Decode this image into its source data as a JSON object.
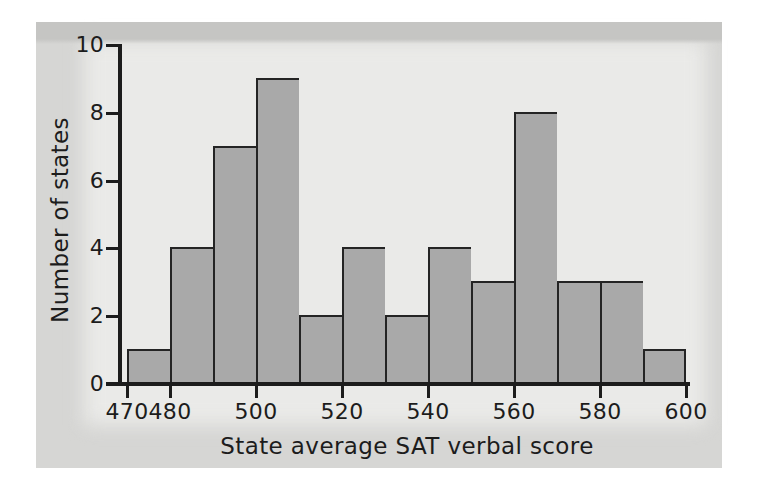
{
  "chart_data": {
    "type": "bar",
    "variant": "histogram",
    "title": "",
    "xlabel": "State average SAT verbal score",
    "ylabel": "Number of states",
    "bin_edges": [
      470,
      480,
      490,
      500,
      510,
      520,
      530,
      540,
      550,
      560,
      570,
      580,
      590,
      600
    ],
    "categories": [
      "470-480",
      "480-490",
      "490-500",
      "500-510",
      "510-520",
      "520-530",
      "530-540",
      "540-550",
      "550-560",
      "560-570",
      "570-580",
      "580-590",
      "590-600"
    ],
    "values": [
      1,
      4,
      7,
      9,
      2,
      4,
      2,
      4,
      3,
      8,
      3,
      3,
      1
    ],
    "x_ticks": [
      470,
      480,
      500,
      520,
      540,
      560,
      580,
      600
    ],
    "y_ticks": [
      0,
      2,
      4,
      6,
      8,
      10
    ],
    "xlim": [
      470,
      600
    ],
    "ylim": [
      0,
      10
    ],
    "grid": false,
    "legend": "none",
    "bar_gap": 0
  },
  "style": {
    "page_bg": "#ffffff",
    "panel_bg": "#d6d6d4",
    "panel_top_band": "#c5c5c3",
    "plot_bg": "#eaeae8",
    "bar_fill": "#a9a9a9",
    "bar_border": "#242424",
    "axis_color": "#1c1c1c",
    "label_color": "#1c1c1c"
  }
}
